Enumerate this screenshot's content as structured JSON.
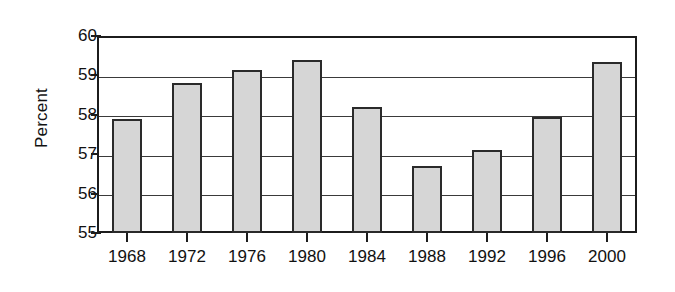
{
  "chart_data": {
    "type": "bar",
    "title": "",
    "xlabel": "",
    "ylabel": "Percent",
    "categories": [
      "1968",
      "1972",
      "1976",
      "1980",
      "1984",
      "1988",
      "1992",
      "1996",
      "2000"
    ],
    "values": [
      57.9,
      58.8,
      59.15,
      59.4,
      58.2,
      56.7,
      57.1,
      57.95,
      59.35
    ],
    "ylim": [
      55,
      60
    ],
    "yticks": [
      "55",
      "56",
      "57",
      "58",
      "59",
      "60"
    ],
    "ytick_values": [
      55,
      56,
      57,
      58,
      59,
      60
    ],
    "grid": "horizontal",
    "legend": "none",
    "bar_fill_color": "#d6d6d6",
    "bar_border_color": "#2a2a2a",
    "axis_color": "#1c1c1c",
    "background_color": "#ffffff"
  }
}
